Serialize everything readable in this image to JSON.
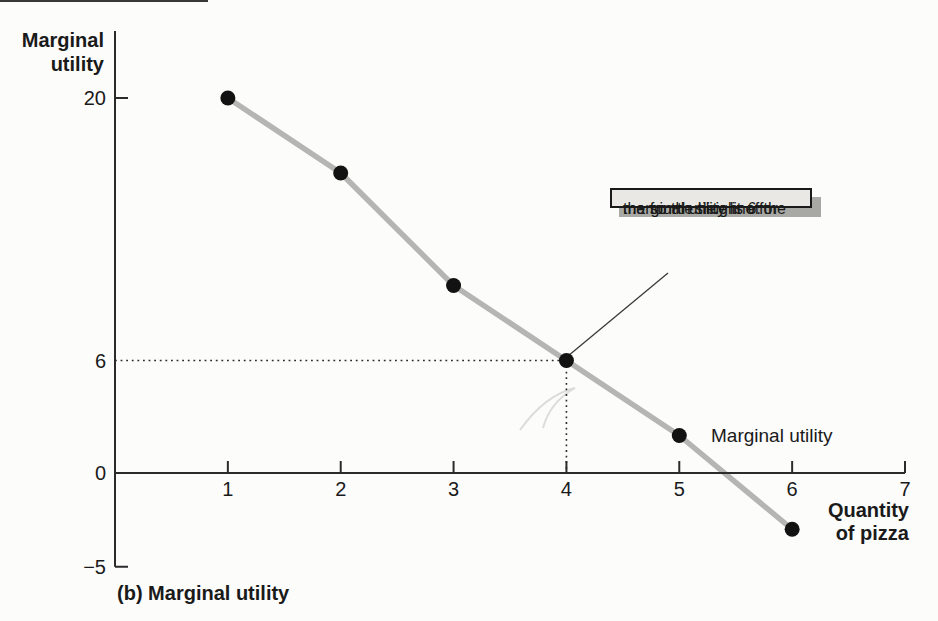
{
  "figure": {
    "caption": "(b) Marginal utility",
    "y_axis_title_lines": [
      "Marginal",
      "utility"
    ],
    "x_axis_title_lines": [
      "Quantity",
      "of pizza"
    ],
    "series_label": "Marginal utility",
    "callout": {
      "lines": [
        ". . . so the height of the",
        "marginal utility line for",
        "the fourth slice is 6."
      ]
    }
  },
  "chart_data": {
    "type": "line",
    "title": "(b) Marginal utility",
    "xlabel": "Quantity of pizza",
    "ylabel": "Marginal utility",
    "series": [
      {
        "name": "Marginal utility",
        "x": [
          1,
          2,
          3,
          4,
          5,
          6
        ],
        "values": [
          20,
          16,
          10,
          6,
          2,
          -3
        ]
      }
    ],
    "x_ticks": [
      1,
      2,
      3,
      4,
      5,
      6,
      7
    ],
    "y_ticks_labeled": [
      {
        "value": 20,
        "label": "20",
        "tick": true
      },
      {
        "value": 6,
        "label": "6",
        "tick": false
      },
      {
        "value": 0,
        "label": "0",
        "tick": false
      },
      {
        "value": -5,
        "label": "−5",
        "tick": true
      }
    ],
    "xlim": [
      0,
      7
    ],
    "ylim": [
      -5,
      20
    ],
    "grid": false,
    "reference_lines": {
      "dotted_horizontal_y": 6,
      "dotted_vertical_x": 4
    },
    "annotation": {
      "text": ". . . so the height of the marginal utility line for the fourth slice is 6.",
      "points_to": {
        "x": 4,
        "y": 6
      }
    },
    "colors": {
      "line": "#b5b5b3",
      "point": "#121212",
      "axis": "#2b2b2b",
      "dotted": "#2b2b2b",
      "callout_bg": "#e9e8e4",
      "callout_border": "#1a1a1a",
      "callout_shadow": "#a8a8a4",
      "leader": "#3a3a3a"
    }
  }
}
